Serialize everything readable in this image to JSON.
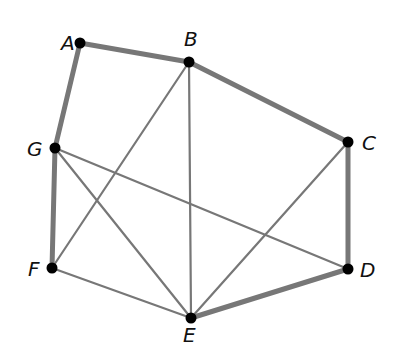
{
  "graph": {
    "nodes": [
      {
        "id": "A",
        "x": 80,
        "y": 43,
        "lx": 61,
        "ly": 50
      },
      {
        "id": "B",
        "x": 189,
        "y": 62,
        "lx": 184,
        "ly": 46
      },
      {
        "id": "C",
        "x": 348,
        "y": 142,
        "lx": 362,
        "ly": 150
      },
      {
        "id": "D",
        "x": 348,
        "y": 269,
        "lx": 360,
        "ly": 277
      },
      {
        "id": "E",
        "x": 191,
        "y": 318,
        "lx": 183,
        "ly": 342
      },
      {
        "id": "F",
        "x": 52,
        "y": 268,
        "lx": 28,
        "ly": 276
      },
      {
        "id": "G",
        "x": 55,
        "y": 148,
        "lx": 27,
        "ly": 156
      }
    ],
    "edges": [
      {
        "from": "A",
        "to": "B",
        "thick": true
      },
      {
        "from": "B",
        "to": "C",
        "thick": true
      },
      {
        "from": "C",
        "to": "D",
        "thick": true
      },
      {
        "from": "D",
        "to": "E",
        "thick": true
      },
      {
        "from": "F",
        "to": "G",
        "thick": true
      },
      {
        "from": "G",
        "to": "A",
        "thick": true
      },
      {
        "from": "E",
        "to": "F",
        "thick": false
      },
      {
        "from": "B",
        "to": "F",
        "thick": false
      },
      {
        "from": "B",
        "to": "E",
        "thick": false
      },
      {
        "from": "C",
        "to": "E",
        "thick": false
      },
      {
        "from": "G",
        "to": "E",
        "thick": false
      },
      {
        "from": "G",
        "to": "D",
        "thick": false
      }
    ],
    "colors": {
      "edge": "#777777",
      "node": "#000000",
      "label": "#111111"
    }
  }
}
